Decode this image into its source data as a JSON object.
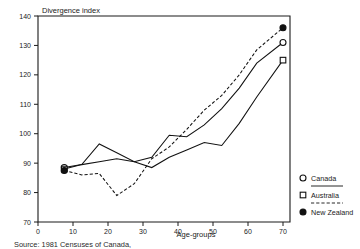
{
  "chart_data": {
    "type": "line",
    "title": "",
    "ylabel": "Divergence index",
    "xlabel": "Age-groups",
    "xlim": [
      0,
      72
    ],
    "ylim": [
      70,
      140
    ],
    "xticks": [
      0,
      10,
      20,
      30,
      40,
      50,
      60,
      70
    ],
    "yticks": [
      70,
      80,
      90,
      100,
      110,
      120,
      130,
      140
    ],
    "grid": false,
    "legend_position": "right-bottom",
    "x": [
      7.5,
      12.5,
      17.5,
      22.5,
      27.5,
      32.5,
      37.5,
      42.5,
      47.5,
      52.5,
      57.5,
      62.5,
      70
    ],
    "series": [
      {
        "name": "Canada",
        "marker": "open-circle",
        "linestyle": "solid",
        "values": [
          88.5,
          89.5,
          96.5,
          93.5,
          90.5,
          92.0,
          99.5,
          99.0,
          103.0,
          108.5,
          115.5,
          124.0,
          131.0
        ]
      },
      {
        "name": "Australia",
        "marker": "open-square",
        "linestyle": "solid",
        "values": [
          88.0,
          89.5,
          90.5,
          91.5,
          90.5,
          88.5,
          92.0,
          94.5,
          97.0,
          96.0,
          103.5,
          112.5,
          125.0
        ]
      },
      {
        "name": "New Zealand",
        "marker": "filled-circle",
        "linestyle": "dashed",
        "values": [
          87.5,
          86.0,
          86.5,
          79.0,
          83.0,
          91.5,
          95.5,
          101.5,
          108.0,
          113.0,
          120.0,
          128.5,
          136.0
        ]
      }
    ]
  },
  "axes": {
    "y_axis_title": "Divergence index",
    "x_axis_title": "Age-groups",
    "x_tick_labels": [
      "0",
      "10",
      "20",
      "30",
      "40",
      "50",
      "60",
      "70"
    ],
    "y_tick_labels": [
      "70",
      "80",
      "90",
      "100",
      "110",
      "120",
      "130",
      "140"
    ]
  },
  "legend": {
    "entries": [
      {
        "label": "Canada",
        "marker": "open-circle"
      },
      {
        "label": "Australia",
        "marker": "open-square"
      },
      {
        "label": "New Zealand",
        "marker": "filled-circle"
      }
    ]
  },
  "footer": {
    "source_text": "Source: 1981 Censuses of Canada,"
  }
}
